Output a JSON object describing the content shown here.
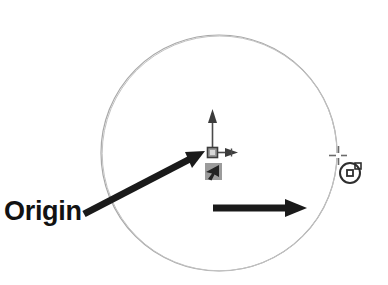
{
  "drawing": {
    "title": "Origin",
    "kind": "cad-drawing-annotation",
    "background_color": "#ffffff"
  },
  "annotations": {
    "origin_label": "Origin"
  },
  "colors": {
    "circle_stroke": "#a8a8a8",
    "arrow_fill": "#1a1a1a",
    "ucs_icon_fill": "#9a9a9a",
    "ucs_icon_stroke": "#3c3c3c",
    "cursor_icon_fill": "#8f8f8f",
    "cursor_icon_stroke": "#2b2b2b",
    "snap_marker_stroke": "#2e2e2e",
    "crosshair_stroke": "#6b6b6b",
    "label_color": "#121212"
  },
  "geometry": {
    "circle": {
      "name": "drawn-circle",
      "center_x": 219,
      "center_y": 153,
      "radius": 118,
      "stroke_width": 1.1
    },
    "ucs_origin_icon": {
      "name": "ucs-origin-icon",
      "x": 208,
      "y": 148,
      "box_size": 9,
      "y_axis_length": 42,
      "x_axis_length": 22
    },
    "cursor_icon": {
      "name": "pick-cursor-icon",
      "x": 205,
      "y": 164,
      "size": 16
    },
    "crosshair_cursor": {
      "name": "crosshair-cursor",
      "center_x": 338,
      "center_y": 155,
      "arm_length": 9
    },
    "snap_marker": {
      "name": "object-snap-marker",
      "center_x": 350,
      "center_y": 173,
      "radius": 10,
      "inner_square": 5
    },
    "leader_arrow": {
      "name": "leader-arrow-to-origin",
      "x1": 84,
      "y1": 214,
      "x2": 203,
      "y2": 152,
      "thickness": 7
    },
    "horizontal_arrow": {
      "name": "horizontal-direction-arrow",
      "x1": 213,
      "y1": 208,
      "x2": 306,
      "y2": 208,
      "thickness": 7
    }
  }
}
